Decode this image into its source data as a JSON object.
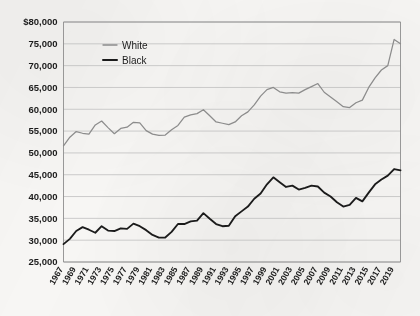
{
  "chart_data": {
    "type": "line",
    "title": "",
    "subtitle": "",
    "xlabel": "",
    "ylabel": "",
    "ylim": [
      25000,
      80000
    ],
    "ytick_values": [
      25000,
      30000,
      35000,
      40000,
      45000,
      50000,
      55000,
      60000,
      65000,
      70000,
      75000,
      80000
    ],
    "ytick_labels": [
      "25,000",
      "30,000",
      "35,000",
      "40,000",
      "45,000",
      "50,000",
      "55,000",
      "60,000",
      "65,000",
      "70,000",
      "75,000",
      "$80,000"
    ],
    "grid": true,
    "legend_position": "top-left-inside",
    "xlim": [
      1967,
      2020
    ],
    "x": [
      1967,
      1968,
      1969,
      1970,
      1971,
      1972,
      1973,
      1974,
      1975,
      1976,
      1977,
      1978,
      1979,
      1980,
      1981,
      1982,
      1983,
      1984,
      1985,
      1986,
      1987,
      1988,
      1989,
      1990,
      1991,
      1992,
      1993,
      1994,
      1995,
      1996,
      1997,
      1998,
      1999,
      2000,
      2001,
      2002,
      2003,
      2004,
      2005,
      2006,
      2007,
      2008,
      2009,
      2010,
      2011,
      2012,
      2013,
      2014,
      2015,
      2016,
      2017,
      2018,
      2019,
      2020
    ],
    "xtick_labels": [
      "1967",
      "1969",
      "1971",
      "1973",
      "1975",
      "1977",
      "1979",
      "1981",
      "1983",
      "1985",
      "1987",
      "1989",
      "1991",
      "1993",
      "1995",
      "1997",
      "1999",
      "2001",
      "2003",
      "2005",
      "2007",
      "2009",
      "2011",
      "2013",
      "2015",
      "2017",
      "2019"
    ],
    "series": [
      {
        "name": "White",
        "color": "#8c8c8c",
        "values": [
          51600,
          53600,
          54900,
          54500,
          54300,
          56400,
          57300,
          55800,
          54400,
          55600,
          55900,
          57000,
          56900,
          55100,
          54300,
          54000,
          54100,
          55300,
          56300,
          58200,
          58700,
          59000,
          59900,
          58500,
          57100,
          56800,
          56500,
          57100,
          58500,
          59400,
          61000,
          63000,
          64500,
          65000,
          64000,
          63700,
          63800,
          63700,
          64500,
          65200,
          65900,
          63900,
          62800,
          61700,
          60600,
          60400,
          61500,
          62100,
          65000,
          67200,
          69000,
          70000,
          76000,
          75000
        ]
      },
      {
        "name": "Black",
        "color": "#1b1b1b",
        "values": [
          29100,
          30300,
          32100,
          33000,
          32400,
          31700,
          33200,
          32200,
          32100,
          32700,
          32600,
          33800,
          33200,
          32300,
          31200,
          30600,
          30600,
          31900,
          33700,
          33700,
          34300,
          34500,
          36200,
          34900,
          33700,
          33200,
          33300,
          35500,
          36600,
          37700,
          39500,
          40700,
          42800,
          44400,
          43300,
          42200,
          42500,
          41600,
          42000,
          42500,
          42300,
          40900,
          40000,
          38700,
          37700,
          38100,
          39700,
          38900,
          40900,
          42800,
          43900,
          44800,
          46300,
          46000
        ]
      }
    ]
  },
  "legend": {
    "items": [
      {
        "label": "White",
        "color": "#8c8c8c"
      },
      {
        "label": "Black",
        "color": "#1b1b1b"
      }
    ]
  }
}
